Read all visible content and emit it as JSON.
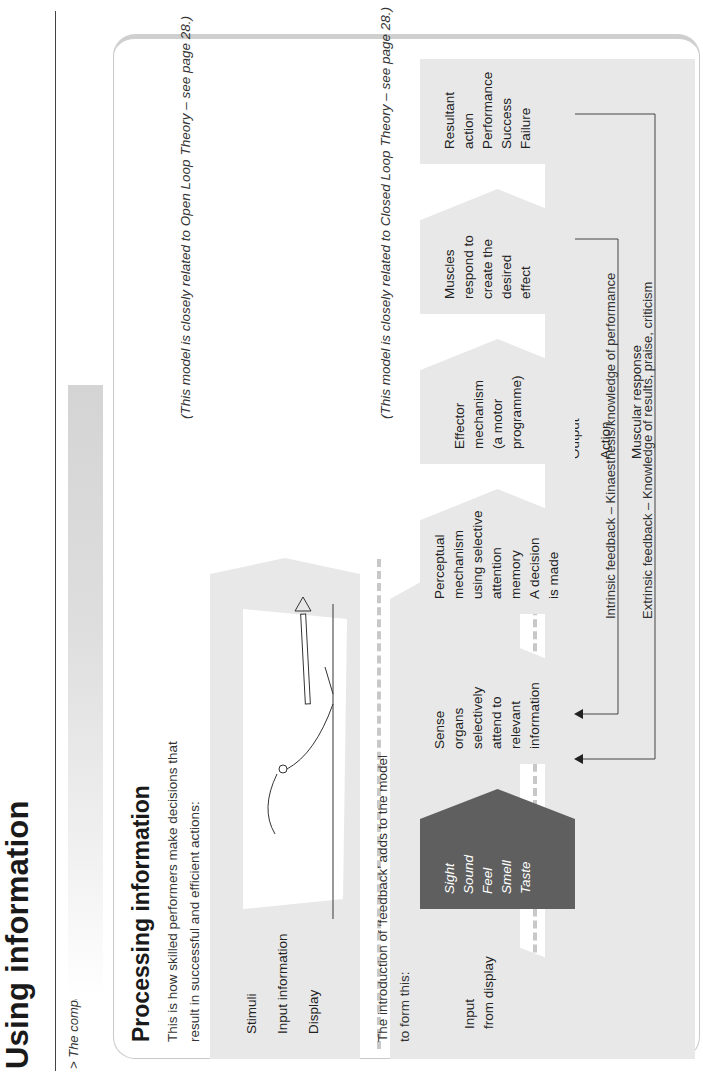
{
  "header": {
    "title": "Using information",
    "caption": "> The computer brain."
  },
  "section": {
    "heading": "Processing information",
    "intro_line1": "This is how skilled performers make decisions that",
    "intro_line2": "result in successful and efficient actions:",
    "open_loop_note": "(This model is closely related to Open Loop Theory – see page 28.)",
    "feedback_intro_line1": "The introduction of ‘feedback’ adds to the model",
    "feedback_intro_line2": "to form this:",
    "closed_loop_note": "(This model is closely related to Closed Loop Theory – see page 28.)"
  },
  "simple_model": {
    "input_panel": [
      "Stimuli",
      "Input information",
      "Display"
    ],
    "processing_panel": [
      "Processing",
      "Decisions",
      "made"
    ],
    "output_panel": [
      "Output",
      "Action",
      "Muscular response"
    ]
  },
  "feedback_model": {
    "stages": [
      {
        "id": "input",
        "lines": [
          "Input",
          "from display"
        ],
        "style": "light"
      },
      {
        "id": "senses",
        "lines": [
          "Sight",
          "Sound",
          "Feel",
          "Smell",
          "Taste"
        ],
        "style": "dark"
      },
      {
        "id": "sense-organs",
        "lines": [
          "Sense",
          "organs",
          "selectively",
          "attend to",
          "relevant",
          "information"
        ],
        "style": "light"
      },
      {
        "id": "perceptual",
        "lines": [
          "Perceptual",
          "mechanism",
          "using selective",
          "attention",
          "memory",
          "",
          "A decision",
          "is made"
        ],
        "style": "light"
      },
      {
        "id": "effector",
        "lines": [
          "Effector",
          "mechanism",
          "(a motor",
          "programme)"
        ],
        "style": "light"
      },
      {
        "id": "muscles",
        "lines": [
          "Muscles",
          "respond to",
          "create the",
          "desired",
          "effect"
        ],
        "style": "light"
      },
      {
        "id": "resultant",
        "lines": [
          "Resultant",
          "action",
          "Performance",
          "Success",
          "Failure"
        ],
        "style": "light"
      }
    ],
    "intrinsic_feedback": "Intrinsic feedback – Kinaesthesis/knowledge of performance",
    "extrinsic_feedback": "Extrinsic feedback – Knowledge of results, praise, criticism"
  },
  "colors": {
    "panel_light": "#e8e8e8",
    "panel_dark": "#5f5f5f",
    "text": "#222222",
    "border": "#c9c9c9"
  }
}
